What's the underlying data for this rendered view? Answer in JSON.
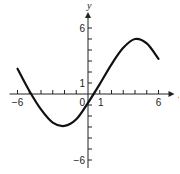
{
  "chart_data": {
    "type": "line",
    "title": "",
    "xlabel": "x",
    "ylabel": "y",
    "xlim": [
      -6,
      6
    ],
    "ylim": [
      -6,
      6
    ],
    "grid": false,
    "x_ticks": [
      -6,
      -5,
      -4,
      -3,
      -2,
      -1,
      0,
      1,
      2,
      3,
      4,
      5,
      6
    ],
    "y_ticks": [
      -6,
      -5,
      -4,
      -3,
      -2,
      -1,
      0,
      1,
      2,
      3,
      4,
      5,
      6
    ],
    "x_tick_labels": [
      {
        "value": -6,
        "text": "−6"
      },
      {
        "value": 0,
        "text": "0"
      },
      {
        "value": 1,
        "text": "1"
      },
      {
        "value": 6,
        "text": "6"
      }
    ],
    "y_tick_labels": [
      {
        "value": 6,
        "text": "6"
      },
      {
        "value": 1,
        "text": "1"
      },
      {
        "value": -6,
        "text": "−6"
      }
    ],
    "series": [
      {
        "name": "f",
        "x": [
          -6,
          -5,
          -4,
          -3,
          -2,
          -1,
          0,
          1,
          2,
          3,
          4,
          5,
          6
        ],
        "y": [
          2.3,
          0.3,
          -1.4,
          -2.6,
          -2.9,
          -2.3,
          -0.8,
          0.9,
          2.7,
          4.2,
          5.0,
          4.6,
          3.2
        ]
      }
    ]
  }
}
